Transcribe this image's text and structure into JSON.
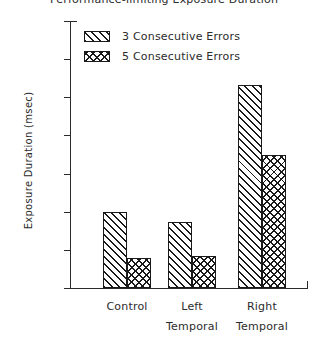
{
  "chart_data": {
    "type": "bar",
    "title": "Performance-limiting Exposure Duration",
    "xlabel": "",
    "ylabel": "Exposure Duration (msec)",
    "ylim": [
      250,
      2000
    ],
    "ytick_step": 250,
    "yticks": [
      2000,
      1750,
      1500,
      1250,
      1000,
      750,
      500,
      250
    ],
    "ytick_labels": [
      "2000",
      "1750",
      "1500",
      "1250",
      "1000",
      "750",
      "500",
      "250"
    ],
    "categories": [
      "Control",
      "Left Temporal",
      "Right Temporal"
    ],
    "category_lines": [
      [
        "Control",
        ""
      ],
      [
        "Left",
        "Temporal"
      ],
      [
        "Right",
        "Temporal"
      ]
    ],
    "series": [
      {
        "name": "3 Consecutive Errors",
        "pattern": "diagonal-hatch",
        "values": [
          750,
          680,
          1580
        ]
      },
      {
        "name": "5 Consecutive Errors",
        "pattern": "cross-hatch",
        "values": [
          450,
          460,
          1120
        ]
      }
    ],
    "grid": false,
    "legend_position": "upper-left-inside",
    "colors": {
      "ink": "#1a1a1a",
      "text": "#2b2b2b",
      "background": "#ffffff"
    }
  }
}
